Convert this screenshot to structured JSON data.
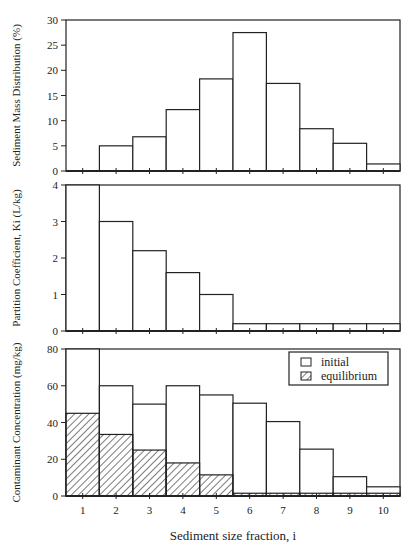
{
  "chart_data": [
    {
      "type": "bar",
      "panel": "top",
      "ylabel": "Sediment Mass Distribution (%)",
      "xlabel": "",
      "categories": [
        "1",
        "2",
        "3",
        "4",
        "5",
        "6",
        "7",
        "8",
        "9",
        "10"
      ],
      "values": [
        0,
        5.0,
        6.8,
        12.2,
        18.3,
        27.5,
        17.4,
        8.4,
        5.5,
        1.4
      ],
      "ylim": [
        0,
        30
      ],
      "yticks": [
        0,
        5,
        10,
        15,
        20,
        25,
        30
      ],
      "grid": false
    },
    {
      "type": "bar",
      "panel": "middle",
      "ylabel": "Partition Coefficient, Ki (L/kg)",
      "xlabel": "",
      "categories": [
        "1",
        "2",
        "3",
        "4",
        "5",
        "6",
        "7",
        "8",
        "9",
        "10"
      ],
      "values": [
        4.0,
        3.0,
        2.2,
        1.6,
        1.0,
        0.2,
        0.2,
        0.2,
        0.2,
        0.2
      ],
      "ylim": [
        0,
        4
      ],
      "yticks": [
        0,
        1,
        2,
        3,
        4
      ],
      "grid": false
    },
    {
      "type": "bar",
      "panel": "bottom",
      "ylabel": "Contaminant Concentration (mg/kg)",
      "xlabel": "Sediment size fraction, i",
      "categories": [
        "1",
        "2",
        "3",
        "4",
        "5",
        "6",
        "7",
        "8",
        "9",
        "10"
      ],
      "series": [
        {
          "name": "initial",
          "pattern": "open",
          "values": [
            80,
            60,
            50,
            60,
            55,
            50.5,
            40.5,
            25.5,
            10.5,
            5
          ]
        },
        {
          "name": "equilibrium",
          "pattern": "hatched",
          "values": [
            45,
            33.5,
            25,
            18,
            11.5,
            1.5,
            1.5,
            1.5,
            1.5,
            1.5
          ]
        }
      ],
      "ylim": [
        0,
        80
      ],
      "yticks": [
        0,
        20,
        40,
        60,
        80
      ],
      "legend_position": "upper right",
      "grid": false
    }
  ],
  "labels": {
    "xlabel": "Sediment size fraction, i",
    "legend": {
      "initial": "initial",
      "equilibrium": "equilibrium"
    }
  },
  "colors": {
    "ink": "#222222",
    "background": "#ffffff"
  }
}
